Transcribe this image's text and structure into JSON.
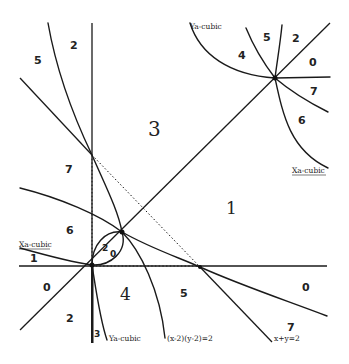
{
  "diagram": {
    "curve_labels": {
      "xa_cubic_left": "Xa-cubic",
      "xa_cubic_topright": "Xa-cubic",
      "ya_cubic_topright": "Ya-cubic",
      "ya_cubic_bottom": "Ya-cubic",
      "hyperbola": "(x-2)(y-2)=2",
      "line_x_plus_y": "x+y=2"
    },
    "regions": {
      "top_left_5": "5",
      "top_left_2": "2",
      "center_3": "3",
      "left_7": "7",
      "right_1": "1",
      "left_6": "6",
      "xa_strip_1": "1",
      "lens_2": "2",
      "lens_0": "0",
      "left_0": "0",
      "bottom_left_2": "2",
      "bottom_3": "3",
      "bottom_4": "4",
      "bottom_5": "5",
      "right_0": "0",
      "bottom_right_7": "7",
      "tr_4": "4",
      "tr_5": "5",
      "tr_2": "2",
      "tr_0": "0",
      "tr_7": "7",
      "tr_6": "6"
    },
    "points": {
      "origin": [
        92,
        265
      ],
      "lens_top": [
        122,
        232
      ],
      "x_intercept_2": [
        200,
        267
      ],
      "y_intercept_2": [
        92,
        155
      ],
      "top_right_node": [
        275,
        78
      ]
    }
  }
}
